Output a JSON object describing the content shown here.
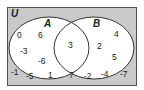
{
  "diagram": {
    "type": "venn",
    "colors": {
      "universe_fill": "#c9c9c9",
      "universe_border": "#555555",
      "set_fill": "#ffffff",
      "set_stroke": "#333333",
      "text": "#222222"
    },
    "universe": {
      "label": "U"
    },
    "sets": [
      {
        "label": "A"
      },
      {
        "label": "B"
      }
    ],
    "regions": {
      "a_only": [
        "0",
        "6",
        "-3",
        "-6"
      ],
      "a_and_b": [
        "3"
      ],
      "b_only": [
        "4",
        "2",
        "5"
      ],
      "outside": [
        "-1",
        "-5",
        "1",
        "7",
        "-2",
        "-4",
        "-7"
      ]
    }
  }
}
